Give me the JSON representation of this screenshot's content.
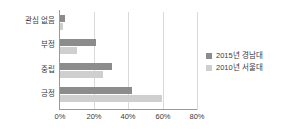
{
  "chart_data": {
    "type": "bar",
    "orientation": "horizontal",
    "title": "",
    "xlabel": "",
    "ylabel": "",
    "categories": [
      "관심 없음",
      "부정",
      "중립",
      "긍정"
    ],
    "series": [
      {
        "name": "2015년 경남대",
        "color": "#8c8c8c",
        "values": [
          3,
          21,
          30,
          42
        ]
      },
      {
        "name": "2010년 서울대",
        "color": "#cfcfcf",
        "values": [
          2,
          10,
          25,
          59
        ]
      }
    ],
    "xlim": [
      0,
      80
    ],
    "xticks": [
      0,
      20,
      40,
      60,
      80
    ],
    "xtick_labels": [
      "0%",
      "20%",
      "40%",
      "60%",
      "80%"
    ],
    "grid": true,
    "legend_position": "right"
  },
  "legend": {
    "items": [
      {
        "label": "2015년 경남대"
      },
      {
        "label": "2010년 서울대"
      }
    ]
  },
  "colors": {
    "series_2015": "#8c8c8c",
    "series_2010": "#cfcfcf",
    "gridline": "#d9d9d9",
    "axis": "#9a9a9a",
    "text": "#3a3a3a",
    "background": "#ffffff"
  }
}
